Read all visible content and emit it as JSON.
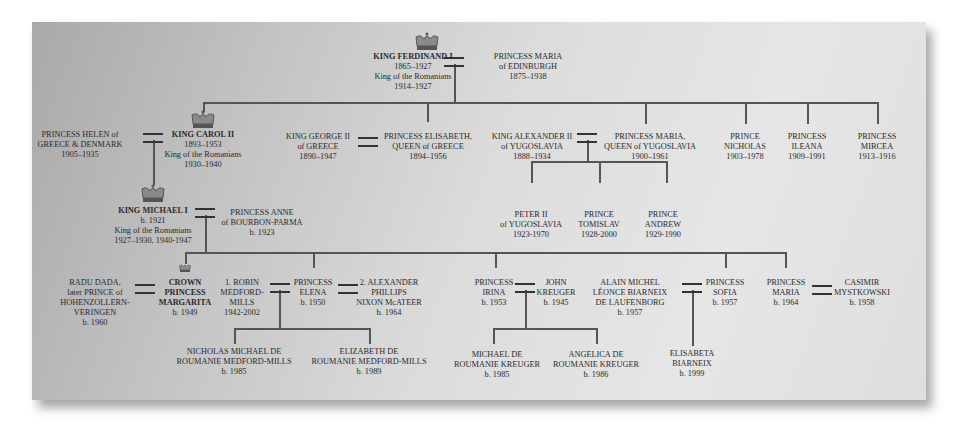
{
  "diagram": {
    "background_gradient": [
      "#a9a9a9",
      "#e6e6e6"
    ],
    "line_color": "#555555",
    "people": {
      "ferdinand": {
        "name": "KING FERDINAND I",
        "lines": [
          "1865–1927",
          "King of the Romanians",
          "1914–1927"
        ],
        "crown": true
      },
      "maria_edinburgh": {
        "name_lines": [
          "PRINCESS MARIA",
          "of EDINBURGH"
        ],
        "dates": "1875–1938"
      },
      "helen": {
        "name_lines": [
          "PRINCESS HELEN of",
          "GREECE & DENMARK"
        ],
        "dates": "1905–1935"
      },
      "carol": {
        "name": "KING CAROL II",
        "lines": [
          "1893–1953",
          "King of the Romanians",
          "1930–1940"
        ],
        "crown": true
      },
      "george": {
        "name_lines": [
          "KING GEORGE II",
          "of GREECE"
        ],
        "dates": "1890–1947"
      },
      "elisabeth": {
        "name_lines": [
          "PRINCESS ELISABETH,",
          "QUEEN of GREECE"
        ],
        "dates": "1894–1956"
      },
      "alexander": {
        "name_lines": [
          "KING ALEXANDER II",
          "of YUGOSLAVIA"
        ],
        "dates": "1888–1934"
      },
      "maria_yugo": {
        "name_lines": [
          "PRINCESS MARIA,",
          "QUEEN of YUGOSLAVIA"
        ],
        "dates": "1900–1961"
      },
      "nicholas": {
        "name_lines": [
          "PRINCE",
          "NICHOLAS"
        ],
        "dates": "1903–1978"
      },
      "ileana": {
        "name_lines": [
          "PRINCESS",
          "ILEANA"
        ],
        "dates": "1909–1991"
      },
      "mircea": {
        "name_lines": [
          "PRINCESS",
          "MIRCEA"
        ],
        "dates": "1913–1916"
      },
      "peter": {
        "name_lines": [
          "PETER II",
          "of YUGOSLAVIA"
        ],
        "dates": "1923-1970"
      },
      "tomislav": {
        "name_lines": [
          "PRINCE",
          "TOMISLAV"
        ],
        "dates": "1928-2000"
      },
      "andrew": {
        "name_lines": [
          "PRINCE",
          "ANDREW"
        ],
        "dates": "1929-1990"
      },
      "michael": {
        "name": "KING MICHAEL I",
        "lines": [
          "b. 1921",
          "King of the Romanians",
          "1927–1930, 1940-1947"
        ],
        "crown": true
      },
      "anne": {
        "name_lines": [
          "PRINCESS ANNE",
          "of BOURBON-PARMA"
        ],
        "dates": "b. 1923"
      },
      "radu": {
        "name_lines": [
          "RADU DADA,",
          "later PRINCE of",
          "HOHENZOLLERN-",
          "VERINGEN"
        ],
        "dates": "b. 1960"
      },
      "margarita": {
        "name_lines": [
          "CROWN",
          "PRINCESS",
          "MARGARITA"
        ],
        "dates": "b. 1949",
        "crown": true
      },
      "robin": {
        "name_lines": [
          "1. ROBIN",
          "MEDFORD-",
          "MILLS"
        ],
        "dates": "1942-2002"
      },
      "elena": {
        "name_lines": [
          "PRINCESS",
          "ELENA"
        ],
        "dates": "b. 1950"
      },
      "alexander_mcateer": {
        "name_lines": [
          "2. ALEXANDER",
          "PHILLIPS",
          "NIXON McATEER"
        ],
        "dates": "b. 1964"
      },
      "nicholas_mm": {
        "name_lines": [
          "NICHOLAS MICHAEL DE",
          "ROUMANIE MEDFORD-MILLS"
        ],
        "dates": "b. 1985"
      },
      "elizabeth_mm": {
        "name_lines": [
          "ELIZABETH DE",
          "ROUMANIE MEDFORD-MILLS"
        ],
        "dates": "b. 1989"
      },
      "irina": {
        "name_lines": [
          "PRINCESS",
          "IRINA"
        ],
        "dates": "b. 1953"
      },
      "john": {
        "name_lines": [
          "JOHN",
          "KREUGER"
        ],
        "dates": "b. 1945"
      },
      "michael_k": {
        "name_lines": [
          "MICHAEL DE",
          "ROUMANIE KREUGER"
        ],
        "dates": "b. 1985"
      },
      "angelica": {
        "name_lines": [
          "ANGELICA DE",
          "ROUMANIE KREUGER"
        ],
        "dates": "b. 1986"
      },
      "alain": {
        "name_lines": [
          "ALAIN MICHEL",
          "LÉONCE BIARNEIX",
          "DE LAUFENBORG"
        ],
        "dates": "b. 1957"
      },
      "sofia": {
        "name_lines": [
          "PRINCESS",
          "SOFIA"
        ],
        "dates": "b. 1957"
      },
      "elisabeta": {
        "name_lines": [
          "ELISABETA",
          "BIARNEIX"
        ],
        "dates": "b. 1999"
      },
      "maria_b1964": {
        "name_lines": [
          "PRINCESS",
          "MARIA"
        ],
        "dates": "b. 1964"
      },
      "casimir": {
        "name_lines": [
          "CASIMIR",
          "MYSTKOWSKI"
        ],
        "dates": "b. 1958"
      }
    }
  }
}
